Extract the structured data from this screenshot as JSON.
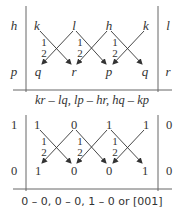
{
  "top_panel": {
    "left_label_top": "h",
    "left_label_bottom": "p",
    "right_label_top": "l",
    "right_label_bottom": "r",
    "top_row": [
      "k",
      "l",
      "h",
      "k"
    ],
    "bottom_row": [
      "q",
      "r",
      "p",
      "q"
    ],
    "step_marks": [
      [
        "1",
        "2"
      ],
      [
        "1",
        "2"
      ],
      [
        "1",
        "2"
      ]
    ],
    "caption": "kr – lq, lp – hr, hq – kp"
  },
  "bottom_panel": {
    "left_label_top": "1",
    "left_label_bottom": "0",
    "right_label_top": "0",
    "right_label_bottom": "0",
    "top_row": [
      "1",
      "0",
      "1",
      "1"
    ],
    "bottom_row": [
      "1",
      "0",
      "0",
      "1"
    ],
    "step_marks": [
      [
        "1",
        "2"
      ],
      [
        "1",
        "2"
      ],
      [
        "1",
        "2"
      ]
    ],
    "caption": "0 – 0, 0 – 0, 1 – 0 or [001]"
  },
  "colors": {
    "ink": "#333333",
    "rule": "#666666"
  }
}
